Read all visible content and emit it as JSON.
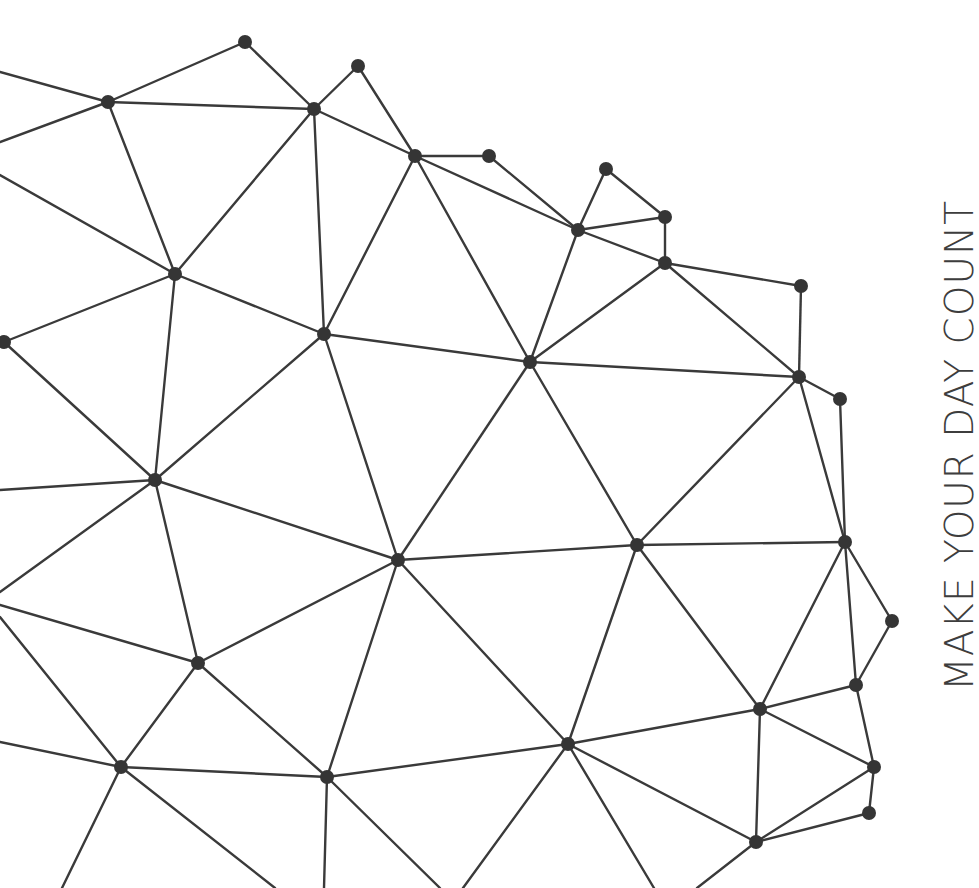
{
  "tagline": "MAKE YOUR DAY COUNT",
  "colors": {
    "background": "#ffffff",
    "line": "#3a3a3a",
    "node": "#353535",
    "text": "#3d3d3d"
  },
  "network": {
    "node_radius": 7,
    "nodes": {
      "A": [
        245,
        42
      ],
      "B": [
        108,
        102
      ],
      "C": [
        314,
        109
      ],
      "D": [
        358,
        66
      ],
      "E": [
        415,
        156
      ],
      "F": [
        489,
        156
      ],
      "G": [
        606,
        169
      ],
      "H": [
        578,
        230
      ],
      "I": [
        665,
        217
      ],
      "J": [
        665,
        263
      ],
      "K": [
        801,
        286
      ],
      "L": [
        175,
        274
      ],
      "M": [
        324,
        334
      ],
      "N": [
        4,
        342
      ],
      "O": [
        530,
        362
      ],
      "P": [
        799,
        377
      ],
      "Q": [
        840,
        399
      ],
      "R": [
        155,
        480
      ],
      "S": [
        398,
        560
      ],
      "T": [
        637,
        545
      ],
      "U": [
        845,
        542
      ],
      "V": [
        892,
        621
      ],
      "W": [
        198,
        663
      ],
      "X": [
        856,
        685
      ],
      "Y": [
        760,
        709
      ],
      "Z": [
        568,
        744
      ],
      "AA": [
        121,
        767
      ],
      "AB": [
        327,
        777
      ],
      "AC": [
        874,
        767
      ],
      "AD": [
        869,
        813
      ],
      "AE": [
        756,
        842
      ]
    },
    "edges": [
      [
        "A",
        "B"
      ],
      [
        "A",
        "C"
      ],
      [
        "B",
        "C"
      ],
      [
        "C",
        "D"
      ],
      [
        "D",
        "E"
      ],
      [
        "C",
        "E"
      ],
      [
        "C",
        "L"
      ],
      [
        "C",
        "M"
      ],
      [
        "B",
        "L"
      ],
      [
        "E",
        "F"
      ],
      [
        "E",
        "M"
      ],
      [
        "E",
        "O"
      ],
      [
        "E",
        "H"
      ],
      [
        "F",
        "H"
      ],
      [
        "G",
        "H"
      ],
      [
        "G",
        "I"
      ],
      [
        "H",
        "I"
      ],
      [
        "H",
        "J"
      ],
      [
        "H",
        "O"
      ],
      [
        "I",
        "J"
      ],
      [
        "J",
        "K"
      ],
      [
        "J",
        "O"
      ],
      [
        "J",
        "P"
      ],
      [
        "K",
        "P"
      ],
      [
        "L",
        "M"
      ],
      [
        "L",
        "N"
      ],
      [
        "L",
        "R"
      ],
      [
        "M",
        "R"
      ],
      [
        "M",
        "S"
      ],
      [
        "M",
        "O"
      ],
      [
        "O",
        "S"
      ],
      [
        "O",
        "T"
      ],
      [
        "O",
        "P"
      ],
      [
        "P",
        "Q"
      ],
      [
        "P",
        "T"
      ],
      [
        "P",
        "U"
      ],
      [
        "Q",
        "U"
      ],
      [
        "N",
        "R"
      ],
      [
        "R",
        "S"
      ],
      [
        "R",
        "W"
      ],
      [
        "S",
        "W"
      ],
      [
        "S",
        "T"
      ],
      [
        "S",
        "Z"
      ],
      [
        "S",
        "AB"
      ],
      [
        "T",
        "U"
      ],
      [
        "T",
        "Y"
      ],
      [
        "T",
        "Z"
      ],
      [
        "U",
        "V"
      ],
      [
        "U",
        "X"
      ],
      [
        "U",
        "Y"
      ],
      [
        "V",
        "X"
      ],
      [
        "X",
        "Y"
      ],
      [
        "X",
        "AC"
      ],
      [
        "Y",
        "AC"
      ],
      [
        "Y",
        "Z"
      ],
      [
        "Y",
        "AE"
      ],
      [
        "AC",
        "AD"
      ],
      [
        "AC",
        "AE"
      ],
      [
        "AD",
        "AE"
      ],
      [
        "Z",
        "AE"
      ],
      [
        "Z",
        "AB"
      ],
      [
        "W",
        "AA"
      ],
      [
        "W",
        "AB"
      ],
      [
        "AA",
        "AB"
      ]
    ],
    "stubs": [
      [
        [
          0,
          72
        ],
        [
          108,
          102
        ]
      ],
      [
        [
          0,
          142
        ],
        [
          108,
          102
        ]
      ],
      [
        [
          0,
          175
        ],
        [
          175,
          274
        ]
      ],
      [
        [
          0,
          490
        ],
        [
          155,
          480
        ]
      ],
      [
        [
          0,
          592
        ],
        [
          155,
          480
        ]
      ],
      [
        [
          0,
          605
        ],
        [
          198,
          663
        ]
      ],
      [
        [
          0,
          617
        ],
        [
          121,
          767
        ]
      ],
      [
        [
          0,
          742
        ],
        [
          121,
          767
        ]
      ],
      [
        [
          121,
          767
        ],
        [
          62,
          888
        ]
      ],
      [
        [
          121,
          767
        ],
        [
          275,
          888
        ]
      ],
      [
        [
          327,
          777
        ],
        [
          324,
          888
        ]
      ],
      [
        [
          327,
          777
        ],
        [
          440,
          888
        ]
      ],
      [
        [
          568,
          744
        ],
        [
          463,
          888
        ]
      ],
      [
        [
          568,
          744
        ],
        [
          654,
          888
        ]
      ],
      [
        [
          756,
          842
        ],
        [
          697,
          888
        ]
      ]
    ]
  }
}
